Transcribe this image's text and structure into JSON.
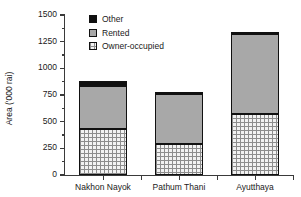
{
  "chart_data": {
    "type": "bar",
    "title": "",
    "subtitle": "",
    "stacked": true,
    "xlabel": "",
    "ylabel": "Area ('000 rai)",
    "categories": [
      "Nakhon Nayok",
      "Pathum Thani",
      "Ayutthaya"
    ],
    "series": [
      {
        "name": "Owner-occupied",
        "values": [
          430,
          290,
          570
        ],
        "color": "#f2f2f2",
        "pattern": "dotted-grid"
      },
      {
        "name": "Rented",
        "values": [
          400,
          470,
          750
        ],
        "color": "#a8a8a8",
        "pattern": "solid"
      },
      {
        "name": "Other",
        "values": [
          50,
          10,
          20
        ],
        "color": "#101010",
        "pattern": "solid"
      }
    ],
    "totals": [
      880,
      770,
      1340
    ],
    "ylim": [
      0,
      1500
    ],
    "y_major_ticks": [
      0,
      250,
      500,
      750,
      1000,
      1250,
      1500
    ],
    "y_tick_labels": [
      "0",
      "250",
      "500",
      "750",
      "1000",
      "1250",
      "1500"
    ],
    "y_minor_tick_interval": 125,
    "grid": false,
    "legend_position": "top-left-inside",
    "legend_entries": [
      "Other",
      "Rented",
      "Owner-occupied"
    ]
  },
  "axis": {
    "y_title": "Area ('000 rai)"
  },
  "legend": {
    "items": [
      {
        "label": "Other"
      },
      {
        "label": "Rented"
      },
      {
        "label": "Owner-occupied"
      }
    ]
  }
}
